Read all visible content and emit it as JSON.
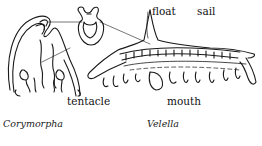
{
  "diagram": {
    "labels": {
      "float": "float",
      "sail": "sail",
      "tentacle": "tentacle",
      "mouth": "mouth"
    },
    "captions": {
      "left": "Corymorpha",
      "right": "Velella"
    },
    "colors": {
      "line": "#1a1a1a",
      "background": "#ffffff"
    }
  }
}
